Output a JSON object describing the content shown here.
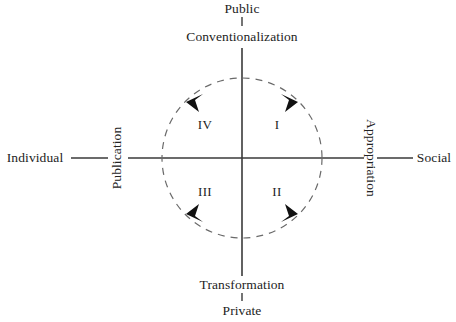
{
  "diagram": {
    "type": "circumplex-axes-diagram",
    "background_color": "#ffffff",
    "line_color": "#3a3a3a",
    "text_color": "#232323",
    "vertical_axis": {
      "top_pole_label": "Public",
      "top_process_label": "Conventionalization",
      "bottom_process_label": "Transformation",
      "bottom_pole_label": "Private"
    },
    "horizontal_axis": {
      "left_pole_label": "Individual",
      "left_process_label": "Publication",
      "right_process_label": "Appropriation",
      "right_pole_label": "Social"
    },
    "quadrants": [
      {
        "label": "IV",
        "position": "top-left"
      },
      {
        "label": "I",
        "position": "top-right"
      },
      {
        "label": "III",
        "position": "bottom-left"
      },
      {
        "label": "II",
        "position": "bottom-right"
      }
    ],
    "cycle": {
      "style": "dashed-circle",
      "direction": "clockwise",
      "arrow_count": 4
    }
  }
}
